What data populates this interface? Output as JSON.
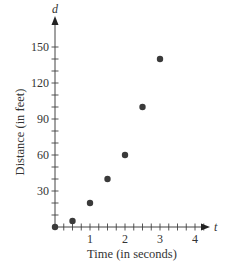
{
  "chart_data": {
    "type": "scatter",
    "title": "",
    "xlabel": "Time (in seconds)",
    "ylabel": "Distance (in feet)",
    "x_axis_var": "t",
    "y_axis_var": "d",
    "xlim": [
      0,
      4.4
    ],
    "ylim": [
      0,
      165
    ],
    "x_ticks": [
      1,
      2,
      3,
      4
    ],
    "x_minor_step": 0.25,
    "y_ticks": [
      30,
      60,
      90,
      120,
      150
    ],
    "y_minor_step": 10,
    "grid": false,
    "legend": null,
    "series": [
      {
        "name": "distance",
        "x": [
          0,
          0.5,
          1,
          1.5,
          2,
          2.5,
          3
        ],
        "y": [
          0,
          5,
          20,
          40,
          60,
          100,
          140
        ],
        "color": "#3a3a3a"
      }
    ]
  },
  "style": {
    "axis_color": "#444444",
    "point_color": "#3a3a3a",
    "text_color": "#333333"
  }
}
